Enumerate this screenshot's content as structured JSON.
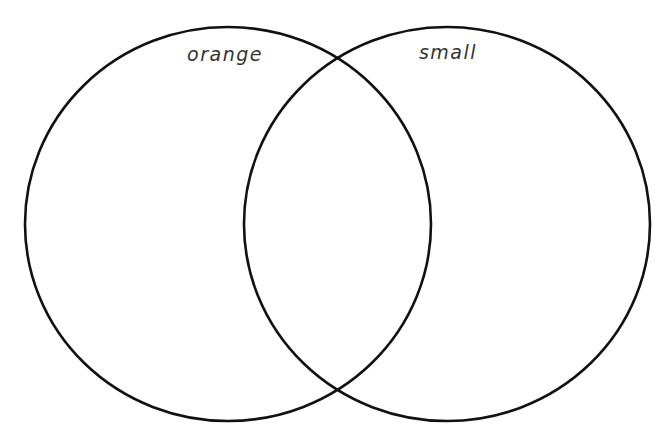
{
  "diagram": {
    "type": "venn",
    "sets": [
      {
        "label": "orange",
        "cx": 228,
        "cy": 224,
        "rx": 203,
        "ry": 197,
        "label_x": 225,
        "label_y": 43
      },
      {
        "label": "small",
        "cx": 447,
        "cy": 224,
        "rx": 203,
        "ry": 197,
        "label_x": 448,
        "label_y": 41
      }
    ],
    "stroke_color": "#111111",
    "stroke_width": 2.6,
    "background": "#ffffff"
  }
}
